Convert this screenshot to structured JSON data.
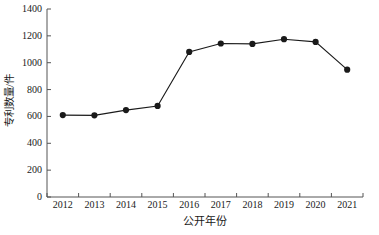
{
  "chart_data": {
    "type": "line",
    "title": "",
    "subtitle": "",
    "xlabel": "公开年份",
    "ylabel": "专利数量/件",
    "categories": [
      "2012",
      "2013",
      "2014",
      "2015",
      "2016",
      "2017",
      "2018",
      "2019",
      "2020",
      "2021"
    ],
    "x": [
      2012,
      2013,
      2014,
      2015,
      2016,
      2017,
      2018,
      2019,
      2020,
      2021
    ],
    "values": [
      610,
      608,
      647,
      678,
      1080,
      1143,
      1140,
      1175,
      1155,
      948
    ],
    "series": [
      {
        "name": "专利数量",
        "values": [
          610,
          608,
          647,
          678,
          1080,
          1143,
          1140,
          1175,
          1155,
          948
        ]
      }
    ],
    "ylim": [
      0,
      1400
    ],
    "yticks": [
      0,
      200,
      400,
      600,
      800,
      1000,
      1200,
      1400
    ],
    "ytick_labels": [
      "0",
      "200",
      "400",
      "600",
      "800",
      "1000",
      "1200",
      "1400"
    ],
    "xtick_labels": [
      "2012",
      "2013",
      "2014",
      "2015",
      "2016",
      "2017",
      "2018",
      "2019",
      "2020",
      "2021"
    ],
    "grid": false,
    "legend": false,
    "legend_position": "none",
    "line_color": "#1a1a1a",
    "marker_color": "#1a1a1a",
    "marker": "circle",
    "axis_color": "#555555",
    "background_color": "#ffffff"
  },
  "axes": {
    "y_title": "专利数量/件",
    "x_title": "公开年份"
  }
}
